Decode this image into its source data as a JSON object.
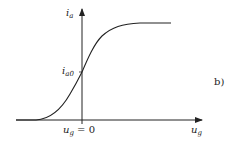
{
  "figure": {
    "panel_label": "b)",
    "y_axis_label": "i",
    "y_axis_label_sub": "a",
    "x_axis_label": "u",
    "x_axis_label_sub": "g",
    "origin_label_var": "u",
    "origin_label_sub": "g",
    "origin_label_rest": " = 0",
    "intercept_label": "i",
    "intercept_label_sub": "a0",
    "curve_description": "sigmoid transfer characteristic: anode current vs grid voltage",
    "line_color": "#222222"
  }
}
